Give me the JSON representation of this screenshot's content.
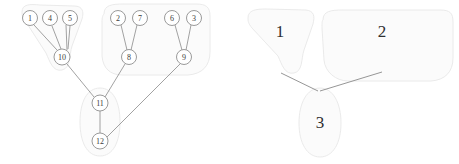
{
  "figure": {
    "width": 459,
    "height": 164,
    "background_color": "#ffffff"
  },
  "colors": {
    "node_stroke": "#8f8f8f",
    "node_fill": "#ffffff",
    "edge": "#8a8a8a",
    "blob_fill": "#fbfbfb",
    "blob_stroke": "#e8e8e8",
    "label_text": "#3c3c3c"
  },
  "left_panel": {
    "name": "detailed-graph",
    "nodes": [
      {
        "id": "n1",
        "label": "1",
        "x": 30,
        "y": 18,
        "r": 7.5,
        "cluster": 1
      },
      {
        "id": "n4",
        "label": "4",
        "x": 50,
        "y": 18,
        "r": 7.5,
        "cluster": 1
      },
      {
        "id": "n5",
        "label": "5",
        "x": 70,
        "y": 18,
        "r": 7.5,
        "cluster": 1
      },
      {
        "id": "n2",
        "label": "2",
        "x": 118,
        "y": 18,
        "r": 7.5,
        "cluster": 2
      },
      {
        "id": "n7",
        "label": "7",
        "x": 140,
        "y": 18,
        "r": 7.5,
        "cluster": 2
      },
      {
        "id": "n6",
        "label": "6",
        "x": 172,
        "y": 18,
        "r": 7.5,
        "cluster": 2
      },
      {
        "id": "n3",
        "label": "3",
        "x": 194,
        "y": 18,
        "r": 7.5,
        "cluster": 2
      },
      {
        "id": "n10",
        "label": "10",
        "x": 62,
        "y": 57,
        "r": 8.0,
        "cluster": 1
      },
      {
        "id": "n8",
        "label": "8",
        "x": 129,
        "y": 57,
        "r": 7.5,
        "cluster": 2
      },
      {
        "id": "n9",
        "label": "9",
        "x": 184,
        "y": 57,
        "r": 7.5,
        "cluster": 2
      },
      {
        "id": "n11",
        "label": "11",
        "x": 100,
        "y": 103,
        "r": 8.0,
        "cluster": 3
      },
      {
        "id": "n12",
        "label": "12",
        "x": 100,
        "y": 141,
        "r": 8.0,
        "cluster": 3
      }
    ],
    "edges": [
      {
        "from": "n1",
        "to": "n10"
      },
      {
        "from": "n4",
        "to": "n10"
      },
      {
        "from": "n5",
        "to": "n10"
      },
      {
        "from": "n2",
        "to": "n8"
      },
      {
        "from": "n7",
        "to": "n8"
      },
      {
        "from": "n6",
        "to": "n9"
      },
      {
        "from": "n3",
        "to": "n9"
      },
      {
        "from": "n10",
        "to": "n11"
      },
      {
        "from": "n8",
        "to": "n11"
      },
      {
        "from": "n11",
        "to": "n12"
      },
      {
        "from": "n9",
        "to": "n12"
      }
    ],
    "clusters": [
      {
        "id": "c1",
        "label": "1",
        "members": [
          "n1",
          "n4",
          "n5",
          "n10"
        ]
      },
      {
        "id": "c2",
        "label": "2",
        "members": [
          "n2",
          "n7",
          "n8",
          "n6",
          "n3",
          "n9"
        ]
      },
      {
        "id": "c3",
        "label": "3",
        "members": [
          "n11",
          "n12"
        ]
      }
    ]
  },
  "right_panel": {
    "name": "supernode-graph",
    "supernodes": [
      {
        "id": "s1",
        "label": "1",
        "cx": 280,
        "cy": 31
      },
      {
        "id": "s2",
        "label": "2",
        "cx": 382,
        "cy": 31
      },
      {
        "id": "s3",
        "label": "3",
        "cx": 320,
        "cy": 122
      }
    ],
    "edges": [
      {
        "from": "s1",
        "to": "s3"
      },
      {
        "from": "s2",
        "to": "s3"
      }
    ]
  }
}
